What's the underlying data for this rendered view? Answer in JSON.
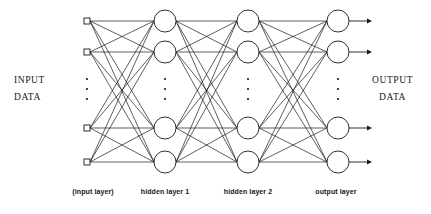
{
  "diagram": {
    "background_color": "#ffffff",
    "stroke_color": "#1a1a1a",
    "node_fill_color": "#ffffff",
    "labels": {
      "input_line1": "INPUT",
      "input_line2": "DATA",
      "output_line1": "OUTPUT",
      "output_line2": "DATA"
    },
    "captions": {
      "input_layer": "(input layer)",
      "hidden_layer_1": "hidden layer 1",
      "hidden_layer_2": "hidden layer 2",
      "output_layer": "output layer"
    },
    "ellipsis_glyph": "·",
    "layers": [
      {
        "id": "input-layer",
        "caption": "(input layer)",
        "node_shape": "square",
        "x": 87,
        "caption_x": 93,
        "node_size": 6,
        "node_rows": [
          21,
          52,
          128,
          162
        ],
        "ellipsis_y": [
          79,
          89,
          99
        ],
        "visible_node_count": 4
      },
      {
        "id": "hidden-layer-1",
        "caption": "hidden layer 1",
        "node_shape": "circle",
        "x": 165,
        "caption_x": 165,
        "node_radius": 11,
        "node_rows": [
          21,
          52,
          128,
          162
        ],
        "ellipsis_y": [
          79,
          89,
          99
        ],
        "visible_node_count": 4
      },
      {
        "id": "hidden-layer-2",
        "caption": "hidden layer 2",
        "node_shape": "circle",
        "x": 248,
        "caption_x": 248,
        "node_radius": 11,
        "node_rows": [
          21,
          52,
          128,
          162
        ],
        "ellipsis_y": [
          79,
          89,
          99
        ],
        "visible_node_count": 4
      },
      {
        "id": "output-layer",
        "caption": "output layer",
        "node_shape": "circle",
        "x": 338,
        "caption_x": 336,
        "node_radius": 11,
        "node_rows": [
          21,
          52,
          128,
          162
        ],
        "ellipsis_y": [
          79,
          89,
          99
        ],
        "visible_node_count": 4,
        "has_output_arrows": true,
        "arrow_end_x": 372
      }
    ],
    "connections": "fully-connected between adjacent layers"
  }
}
